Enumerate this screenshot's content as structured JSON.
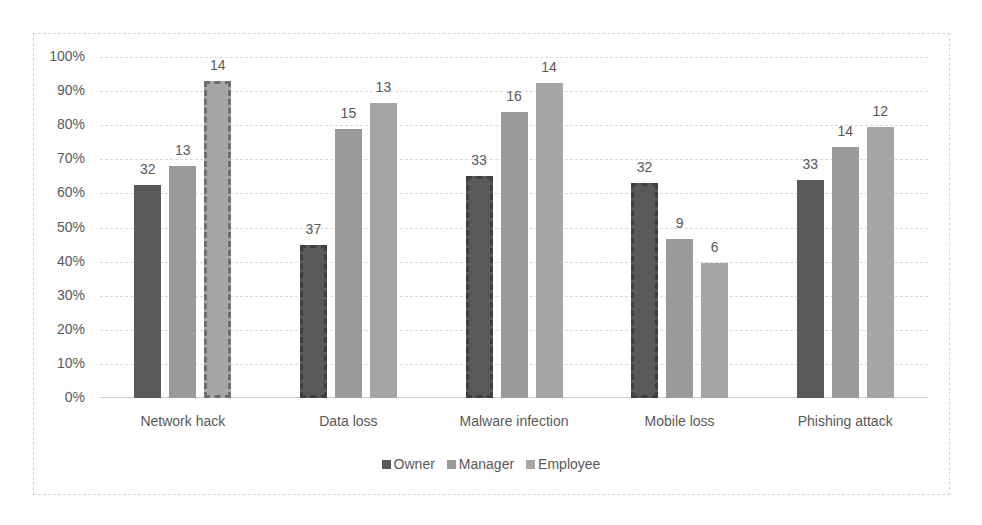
{
  "chart_data": {
    "type": "bar",
    "title": "",
    "xlabel": "",
    "ylabel": "",
    "ylim": [
      0,
      100
    ],
    "y_unit": "%",
    "y_ticks": [
      "0%",
      "10%",
      "20%",
      "30%",
      "40%",
      "50%",
      "60%",
      "70%",
      "80%",
      "90%",
      "100%"
    ],
    "grid": true,
    "legend_position": "bottom",
    "categories": [
      "Network hack",
      "Data loss",
      "Malware infection",
      "Mobile loss",
      "Phishing attack"
    ],
    "series": [
      {
        "name": "Owner",
        "color": "#595959",
        "values": [
          62.5,
          45,
          65,
          63,
          64
        ],
        "data_labels": [
          "32",
          "37",
          "33",
          "32",
          "33"
        ]
      },
      {
        "name": "Manager",
        "color": "#9a9a9a",
        "values": [
          68,
          79,
          84,
          46.5,
          73.5
        ],
        "data_labels": [
          "13",
          "15",
          "16",
          "9",
          "14"
        ]
      },
      {
        "name": "Employee",
        "color": "#a6a6a6",
        "values": [
          93,
          86.5,
          92.5,
          39.5,
          79.5
        ],
        "data_labels": [
          "14",
          "13",
          "14",
          "6",
          "12"
        ]
      }
    ],
    "highlighted_bars": [
      {
        "category": "Network hack",
        "series": "Employee",
        "style": "dashed-outline"
      },
      {
        "category": "Data loss",
        "series": "Owner",
        "style": "dashed-outline"
      },
      {
        "category": "Malware infection",
        "series": "Owner",
        "style": "dashed-outline"
      },
      {
        "category": "Mobile loss",
        "series": "Owner",
        "style": "dashed-outline"
      }
    ]
  },
  "legend": {
    "items": [
      {
        "label": "Owner",
        "color": "#595959"
      },
      {
        "label": "Manager",
        "color": "#9a9a9a"
      },
      {
        "label": "Employee",
        "color": "#a6a6a6"
      }
    ]
  }
}
